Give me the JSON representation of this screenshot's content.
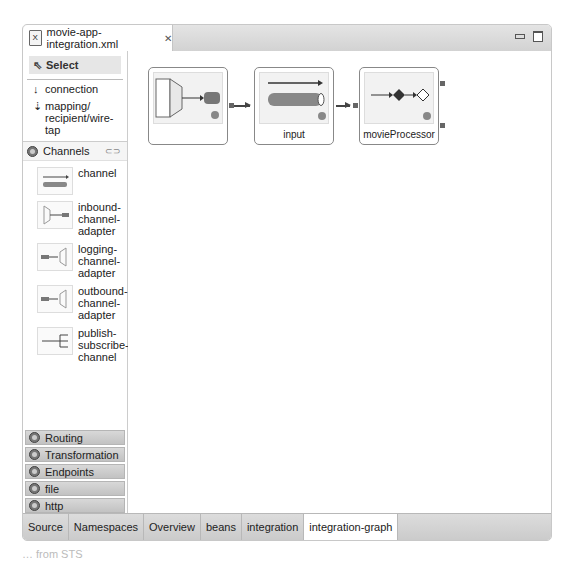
{
  "editor": {
    "tab_title": "movie-app-integration.xml",
    "close_glyph": "✕"
  },
  "palette": {
    "select_label": "Select",
    "tools": [
      {
        "label": "connection",
        "icon": "solid-arrow-down-icon"
      },
      {
        "label": "mapping/ recipient/wire- tap",
        "icon": "dashed-arrow-down-icon"
      }
    ],
    "drawer": {
      "title": "Channels",
      "entries": [
        {
          "label": "channel"
        },
        {
          "label": "inbound- channel- adapter"
        },
        {
          "label": "logging- channel- adapter"
        },
        {
          "label": "outbound- channel- adapter"
        },
        {
          "label": "publish- subscribe- channel"
        }
      ]
    },
    "categories": [
      "Routing",
      "Transformation",
      "Endpoints",
      "file",
      "http"
    ]
  },
  "canvas": {
    "nodes": [
      {
        "label": "",
        "type": "inbound-channel-adapter"
      },
      {
        "label": "input",
        "type": "channel"
      },
      {
        "label": "movieProcessor",
        "type": "service-activator"
      }
    ]
  },
  "bottom_tabs": [
    {
      "label": "Source",
      "active": false
    },
    {
      "label": "Namespaces",
      "active": false
    },
    {
      "label": "Overview",
      "active": false
    },
    {
      "label": "beans",
      "active": false
    },
    {
      "label": "integration",
      "active": false
    },
    {
      "label": "integration-graph",
      "active": true
    }
  ],
  "caption": "… from STS"
}
